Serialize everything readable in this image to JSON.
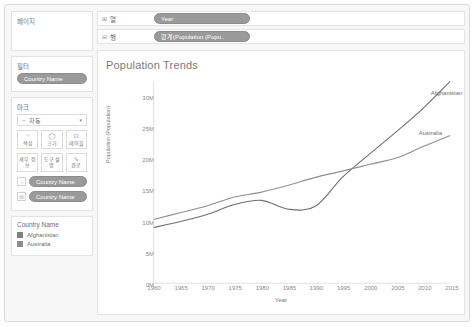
{
  "sidebar": {
    "pages": {
      "title": "페이지"
    },
    "filters": {
      "title": "필터",
      "items": [
        "Country Name"
      ]
    },
    "marks": {
      "title": "마크",
      "type_icon": "~",
      "type_label": "자동",
      "caret": "▾",
      "buttons": [
        {
          "name": "color",
          "icon": "⁘",
          "label": "색상"
        },
        {
          "name": "size",
          "icon": "◯",
          "label": "크기"
        },
        {
          "name": "label",
          "icon": "⊡",
          "label": "레이블"
        },
        {
          "name": "detail",
          "icon": "",
          "label": "세부 정보"
        },
        {
          "name": "tooltip",
          "icon": "",
          "label": "도구 설명"
        },
        {
          "name": "path",
          "icon": "∿",
          "label": "경로"
        }
      ],
      "shelf_items": [
        {
          "icon": "⁘",
          "label": "Country Name"
        },
        {
          "icon": "⊡",
          "label": "Country Name"
        }
      ]
    },
    "legend": {
      "title": "Country Name",
      "items": [
        {
          "label": "Afghanistan",
          "color": "#7f7f7f"
        },
        {
          "label": "Australia",
          "color": "#8c8c8c"
        }
      ]
    }
  },
  "shelves": [
    {
      "icon": "⊞",
      "key": "열",
      "pill": "Year"
    },
    {
      "icon": "⊟",
      "key": "행",
      "pill": "합계(Population (Popu.."
    }
  ],
  "chart_data": {
    "type": "line",
    "title": "Population Trends",
    "xlabel": "Year",
    "ylabel": "Population (Population)",
    "xticks": [
      1960,
      1965,
      1970,
      1975,
      1980,
      1985,
      1990,
      1995,
      2000,
      2005,
      2010,
      2015
    ],
    "yticks": [
      "0M",
      "5M",
      "10M",
      "15M",
      "20M",
      "25M",
      "30M"
    ],
    "ytick_values": [
      0,
      5000000,
      10000000,
      15000000,
      20000000,
      25000000,
      30000000
    ],
    "xlim": [
      1960,
      2015
    ],
    "ylim": [
      0,
      32000000
    ],
    "grid": false,
    "legend_position": "inline-right",
    "x": [
      1960,
      1965,
      1970,
      1975,
      1980,
      1985,
      1990,
      1995,
      2000,
      2005,
      2010,
      2015
    ],
    "series": [
      {
        "name": "Afghanistan",
        "color": "#6e6e6e",
        "label_anchor": {
          "x": 2014,
          "y": 30800000
        },
        "values": [
          8997000,
          9939000,
          11121000,
          12689000,
          13356000,
          11938000,
          12412000,
          17065000,
          20780000,
          24400000,
          28189000,
          32527000
        ]
      },
      {
        "name": "Australia",
        "color": "#8f8f8f",
        "label_anchor": {
          "x": 2011,
          "y": 24300000
        },
        "values": [
          10276000,
          11388000,
          12507000,
          13893000,
          14692000,
          15788000,
          17065000,
          18072000,
          19153000,
          20177000,
          22031000,
          23800000
        ]
      }
    ]
  }
}
